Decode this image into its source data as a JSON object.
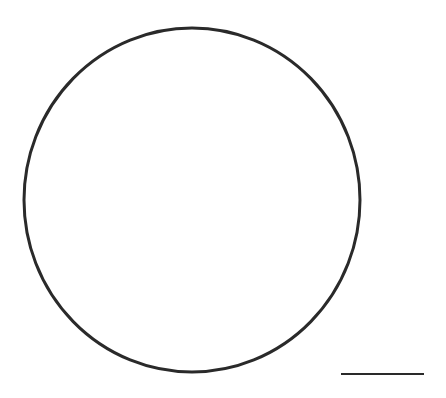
{
  "figure": {
    "background": "#ffffff",
    "stroke_color": "#2a2a2a",
    "circle": {
      "cx": 192,
      "cy": 200,
      "rx": 168,
      "ry": 172,
      "stroke_width": 3
    },
    "scale_bar": {
      "x1": 341,
      "y1": 374,
      "x2": 424,
      "y2": 374,
      "stroke_width": 2,
      "label": ""
    }
  }
}
